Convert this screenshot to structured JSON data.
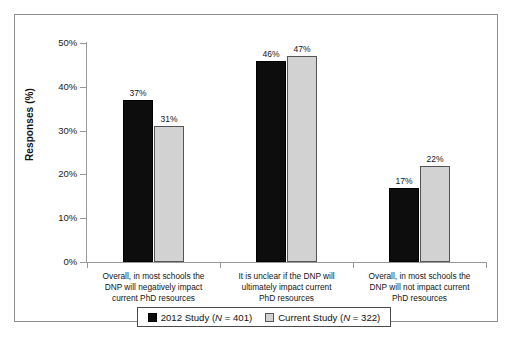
{
  "chart_data": {
    "type": "bar",
    "title": "",
    "xlabel": "",
    "ylabel": "Responses (%)",
    "ylim": [
      0,
      50
    ],
    "ytick_labels": [
      "0%",
      "10%",
      "20%",
      "30%",
      "40%",
      "50%"
    ],
    "ytick_values": [
      0,
      10,
      20,
      30,
      40,
      50
    ],
    "grid": false,
    "legend_position": "bottom",
    "categories": [
      "Overall, in most schools the DNP will negatively impact current PhD resources",
      "It is unclear if the DNP will ultimately impact current PhD resources",
      "Overall, in most schools the DNP will not impact current PhD resources"
    ],
    "category_lines": [
      [
        "Overall, in most schools the",
        "DNP will negatively impact",
        "current PhD resources"
      ],
      [
        "It is unclear if the DNP will",
        "ultimately impact current",
        "PhD resources"
      ],
      [
        "Overall, in most schools the",
        "DNP will not impact current",
        "PhD resources"
      ]
    ],
    "series": [
      {
        "name": "2012 Study (N = 401)",
        "name_prefix": "2012 Study (",
        "name_italic": "N",
        "name_suffix": " = 401)",
        "color": "#0d0d0d",
        "values": [
          37,
          46,
          17
        ],
        "data_labels": [
          "37%",
          "46%",
          "17%"
        ]
      },
      {
        "name": "Current Study (N = 322)",
        "name_prefix": "Current Study (",
        "name_italic": "N",
        "name_suffix": " = 322)",
        "color": "#d2d2d2",
        "values": [
          31,
          47,
          22
        ],
        "data_labels": [
          "31%",
          "47%",
          "22%"
        ]
      }
    ]
  }
}
